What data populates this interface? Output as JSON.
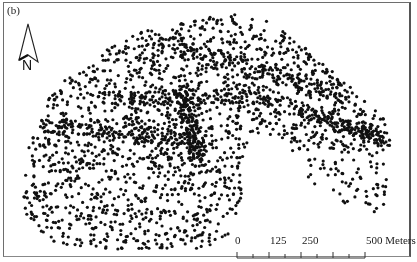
{
  "figure": {
    "panel_label": "(b)",
    "north_arrow": {
      "icon": "north-arrow-icon",
      "label": "N"
    },
    "scale_bar": {
      "labels": [
        {
          "text": "0",
          "meters": 0
        },
        {
          "text": "125",
          "meters": 125
        },
        {
          "text": "250",
          "meters": 250
        },
        {
          "text": "500 Meters",
          "meters": 500
        }
      ],
      "unit": "Meters",
      "max_meters": 500,
      "tick_count": 9
    },
    "point_layer": {
      "description": "Dense point distribution map (black dots) forming an irregular crescent-shaped cloud",
      "dot_color": "#111111",
      "dot_radius": 1.6,
      "approx_point_count": 2600,
      "seed": 7,
      "extent_polygon": [
        [
          22,
          205
        ],
        [
          28,
          150
        ],
        [
          38,
          110
        ],
        [
          62,
          80
        ],
        [
          90,
          62
        ],
        [
          120,
          40
        ],
        [
          160,
          25
        ],
        [
          200,
          18
        ],
        [
          235,
          14
        ],
        [
          265,
          20
        ],
        [
          290,
          35
        ],
        [
          320,
          60
        ],
        [
          345,
          82
        ],
        [
          370,
          105
        ],
        [
          390,
          120
        ],
        [
          392,
          135
        ],
        [
          388,
          158
        ],
        [
          386,
          188
        ],
        [
          382,
          215
        ],
        [
          370,
          212
        ],
        [
          350,
          205
        ],
        [
          330,
          200
        ],
        [
          310,
          185
        ],
        [
          300,
          160
        ],
        [
          282,
          140
        ],
        [
          262,
          132
        ],
        [
          245,
          145
        ],
        [
          240,
          175
        ],
        [
          242,
          200
        ],
        [
          232,
          232
        ],
        [
          205,
          248
        ],
        [
          160,
          250
        ],
        [
          110,
          249
        ],
        [
          60,
          245
        ],
        [
          35,
          232
        ]
      ],
      "dense_bands": [
        {
          "from": [
            45,
            125
          ],
          "to": [
            200,
            140
          ]
        },
        {
          "from": [
            100,
            100
          ],
          "to": [
            280,
            95
          ]
        },
        {
          "from": [
            150,
            40
          ],
          "to": [
            340,
            95
          ]
        },
        {
          "from": [
            300,
            110
          ],
          "to": [
            385,
            140
          ]
        },
        {
          "from": [
            180,
            90
          ],
          "to": [
            200,
            160
          ]
        }
      ]
    }
  },
  "colors": {
    "frame": "#6e6e6e",
    "dot": "#111111",
    "background": "#ffffff"
  }
}
